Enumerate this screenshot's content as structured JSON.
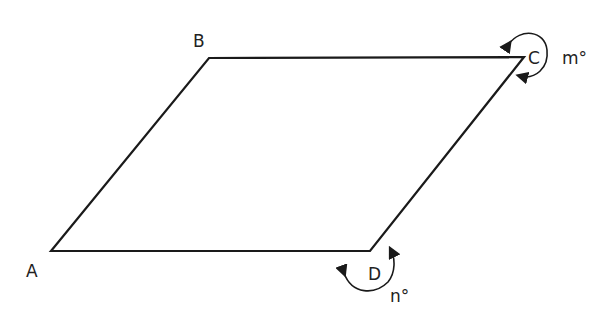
{
  "diagram": {
    "type": "parallelogram",
    "vertices": {
      "A": {
        "label": "A",
        "x": 51,
        "y": 251
      },
      "B": {
        "label": "B",
        "x": 209,
        "y": 58
      },
      "C": {
        "label": "C",
        "x": 524,
        "y": 57
      },
      "D": {
        "label": "D",
        "x": 370,
        "y": 251
      }
    },
    "angles": {
      "C": {
        "label": "m°",
        "description": "reflex angle at C"
      },
      "D": {
        "label": "n°",
        "description": "reflex angle at D"
      }
    },
    "stroke_color": "#1a1a1a"
  }
}
